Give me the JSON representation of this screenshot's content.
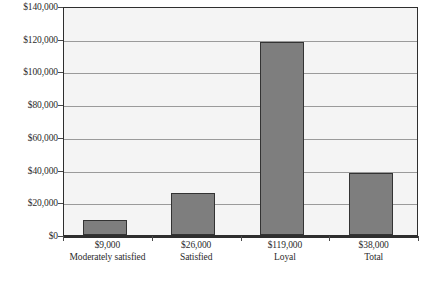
{
  "chart_data": {
    "type": "bar",
    "title": "",
    "subtitle": "",
    "xlabel": "",
    "ylabel": "",
    "categories": [
      "Moderately satisfied",
      "Satisfied",
      "Loyal",
      "Total"
    ],
    "value_labels": [
      "$9,000",
      "$26,000",
      "$119,000",
      "$38,000"
    ],
    "values": [
      9000,
      26000,
      119000,
      38000
    ],
    "ylim": [
      0,
      140000
    ],
    "ytick_values": [
      0,
      20000,
      40000,
      60000,
      80000,
      100000,
      120000,
      140000
    ],
    "ytick_labels": [
      "$0",
      "$20,000",
      "$40,000",
      "$60,000",
      "$80,000",
      "$100,000",
      "$120,000",
      "$140,000"
    ],
    "grid": true,
    "legend": false,
    "legend_position": "none",
    "series": [
      {
        "name": "Customer value",
        "values": [
          9000,
          26000,
          119000,
          38000
        ]
      }
    ],
    "colors": {
      "bar_fill": "#7e7e7e",
      "bar_outline": "#333333",
      "plot_background": "#f4f4f4",
      "gridline": "#9a9a9a",
      "axis": "#2e2e2e",
      "text": "#2b2b2b",
      "page_background": "#ffffff"
    }
  }
}
